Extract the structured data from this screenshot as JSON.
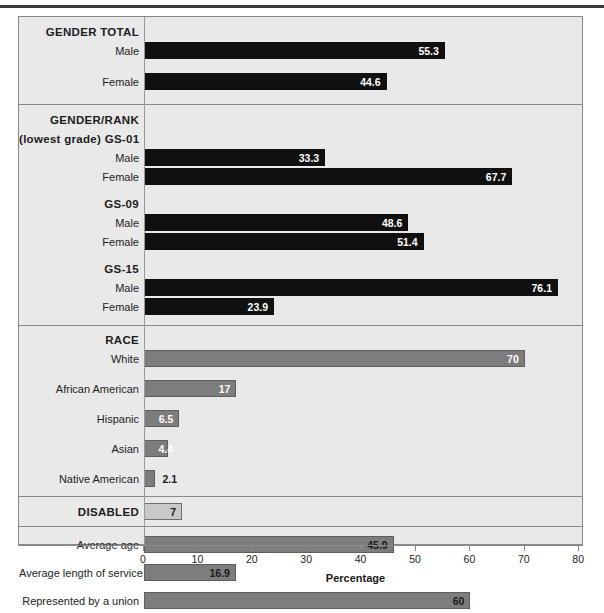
{
  "axis": {
    "title": "Percentage",
    "ticks": [
      0,
      10,
      20,
      30,
      40,
      50,
      60,
      70,
      80
    ],
    "min": 0,
    "max": 80
  },
  "colors": {
    "dark_bar": "#101010",
    "gray_bar": "#7d7d7d",
    "light_bar": "#c9c9c9",
    "panel_background": "#e9e9e9",
    "frame_border": "#8a8a8a"
  },
  "sections": [
    {
      "id": "gender-total",
      "heading": "GENDER TOTAL",
      "subheading": null,
      "rows": [
        {
          "label": "Male",
          "value": 55.3,
          "display": "55.3",
          "style": "dark",
          "label_position": "inside"
        },
        {
          "label": "Female",
          "value": 44.6,
          "display": "44.6",
          "style": "dark",
          "label_position": "inside"
        }
      ]
    },
    {
      "id": "gender-rank",
      "heading": "GENDER/RANK",
      "groups": [
        {
          "prefix": "(lowest grade)",
          "heading": "GS-01",
          "rows": [
            {
              "label": "Male",
              "value": 33.3,
              "display": "33.3",
              "style": "dark",
              "label_position": "inside"
            },
            {
              "label": "Female",
              "value": 67.7,
              "display": "67.7",
              "style": "dark",
              "label_position": "inside"
            }
          ]
        },
        {
          "prefix": null,
          "heading": "GS-09",
          "rows": [
            {
              "label": "Male",
              "value": 48.6,
              "display": "48.6",
              "style": "dark",
              "label_position": "inside"
            },
            {
              "label": "Female",
              "value": 51.4,
              "display": "51.4",
              "style": "dark",
              "label_position": "inside"
            }
          ]
        },
        {
          "prefix": null,
          "heading": "GS-15",
          "rows": [
            {
              "label": "Male",
              "value": 76.1,
              "display": "76.1",
              "style": "dark",
              "label_position": "inside"
            },
            {
              "label": "Female",
              "value": 23.9,
              "display": "23.9",
              "style": "dark",
              "label_position": "inside"
            }
          ]
        }
      ]
    },
    {
      "id": "race",
      "heading": "RACE",
      "rows": [
        {
          "label": "White",
          "value": 70,
          "display": "70",
          "style": "gray",
          "label_position": "inside"
        },
        {
          "label": "African American",
          "value": 17,
          "display": "17",
          "style": "gray",
          "label_position": "inside"
        },
        {
          "label": "Hispanic",
          "value": 6.5,
          "display": "6.5",
          "style": "gray",
          "label_position": "inside"
        },
        {
          "label": "Asian",
          "value": 4.4,
          "display": "4.4",
          "style": "gray",
          "label_position": "inside"
        },
        {
          "label": "Native American",
          "value": 2.1,
          "display": "2.1",
          "style": "gray",
          "label_position": "outside"
        }
      ]
    },
    {
      "id": "disabled",
      "heading": "DISABLED",
      "rows": [
        {
          "label": null,
          "value": 7,
          "display": "7",
          "style": "light",
          "label_position": "inside-dark"
        }
      ]
    },
    {
      "id": "other-measures",
      "heading": null,
      "rows": [
        {
          "label": "Average age",
          "value": 45.9,
          "display": "45.9",
          "style": "gray",
          "label_position": "inside-dark"
        },
        {
          "label": "Average length of service",
          "value": 16.9,
          "display": "16.9",
          "style": "gray",
          "label_position": "inside-dark"
        },
        {
          "label": "Represented by a union",
          "value": 60,
          "display": "60",
          "style": "gray",
          "label_position": "inside-dark"
        }
      ]
    }
  ],
  "chart_data": {
    "type": "bar",
    "orientation": "horizontal",
    "title": "",
    "xlabel": "Percentage",
    "ylabel": "",
    "xlim": [
      0,
      80
    ],
    "xticks": [
      0,
      10,
      20,
      30,
      40,
      50,
      60,
      70,
      80
    ],
    "grid": false,
    "legend": "none",
    "categories": [
      "GENDER TOTAL - Male",
      "GENDER TOTAL - Female",
      "GS-01 Male",
      "GS-01 Female",
      "GS-09 Male",
      "GS-09 Female",
      "GS-15 Male",
      "GS-15 Female",
      "White",
      "African American",
      "Hispanic",
      "Asian",
      "Native American",
      "DISABLED",
      "Average age",
      "Average length of service",
      "Represented by a union"
    ],
    "values": [
      55.3,
      44.6,
      33.3,
      67.7,
      48.6,
      51.4,
      76.1,
      23.9,
      70,
      17,
      6.5,
      4.4,
      2.1,
      7,
      45.9,
      16.9,
      60
    ],
    "groups": [
      {
        "name": "GENDER TOTAL",
        "categories": [
          "Male",
          "Female"
        ],
        "values": [
          55.3,
          44.6
        ]
      },
      {
        "name": "GENDER/RANK (lowest grade) GS-01",
        "categories": [
          "Male",
          "Female"
        ],
        "values": [
          33.3,
          67.7
        ]
      },
      {
        "name": "GS-09",
        "categories": [
          "Male",
          "Female"
        ],
        "values": [
          48.6,
          51.4
        ]
      },
      {
        "name": "GS-15",
        "categories": [
          "Male",
          "Female"
        ],
        "values": [
          76.1,
          23.9
        ]
      },
      {
        "name": "RACE",
        "categories": [
          "White",
          "African American",
          "Hispanic",
          "Asian",
          "Native American"
        ],
        "values": [
          70,
          17,
          6.5,
          4.4,
          2.1
        ]
      },
      {
        "name": "DISABLED",
        "categories": [
          "DISABLED"
        ],
        "values": [
          7
        ]
      },
      {
        "name": "Other",
        "categories": [
          "Average age",
          "Average length of service",
          "Represented by a union"
        ],
        "values": [
          45.9,
          16.9,
          60
        ]
      }
    ]
  }
}
